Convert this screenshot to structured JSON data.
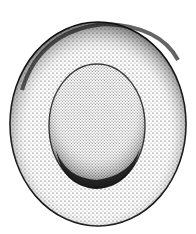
{
  "figure": {
    "background": "#ffffff",
    "ink": "#111111",
    "outer": {
      "cx": 98,
      "cy": 124,
      "rx": 88,
      "ry": 102
    },
    "inner": {
      "cx": 97,
      "cy": 126,
      "rx": 48,
      "ry": 62
    }
  }
}
